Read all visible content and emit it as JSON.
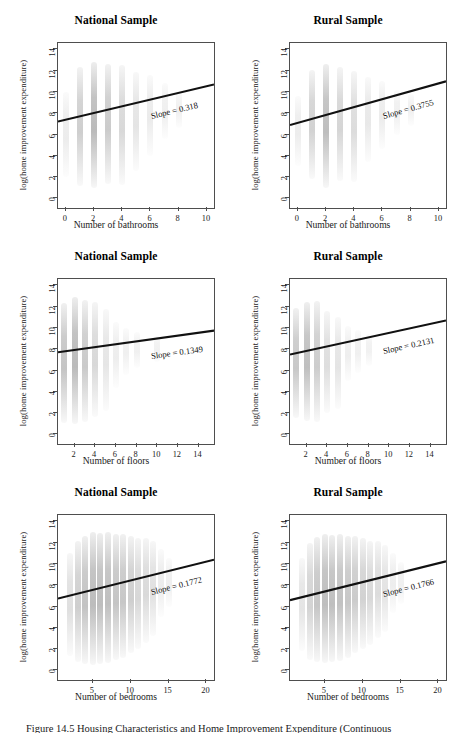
{
  "figure": {
    "caption": "Figure 14.5 Housing Characteristics and Home Improvement Expenditure (Continuous"
  },
  "axis_common": {
    "ylabel": "log(home improvement expenditure)",
    "yticks": [
      "0",
      "2",
      "4",
      "6",
      "8",
      "10",
      "12",
      "14"
    ],
    "ylim": [
      -0.9,
      14.6
    ]
  },
  "chart_data": [
    {
      "type": "scatter",
      "title": "National Sample",
      "xlabel": "Number of bathrooms",
      "ylabel": "log(home improvement expenditure)",
      "xticks": [
        "0",
        "2",
        "4",
        "6",
        "8",
        "10"
      ],
      "yticks": [
        "0",
        "2",
        "4",
        "6",
        "8",
        "10",
        "12",
        "14"
      ],
      "xlim": [
        -0.55,
        10.5
      ],
      "ylim": [
        -0.9,
        14.6
      ],
      "grid": false,
      "annotation": "Slope = 0.318",
      "slope": 0.318,
      "intercept": 7.4,
      "fit_line": {
        "x0": -0.55,
        "y0": 7.22,
        "x1": 10.5,
        "y1": 10.7
      },
      "point_clusters": [
        {
          "x": 0,
          "ymin": 2.0,
          "ymax": 10.0,
          "density": 0.1
        },
        {
          "x": 1,
          "ymin": 1.2,
          "ymax": 12.3,
          "density": 0.55
        },
        {
          "x": 2,
          "ymin": 1.0,
          "ymax": 12.8,
          "density": 0.85
        },
        {
          "x": 3,
          "ymin": 1.4,
          "ymax": 12.6,
          "density": 0.6
        },
        {
          "x": 4,
          "ymin": 1.3,
          "ymax": 12.5,
          "density": 0.4
        },
        {
          "x": 5,
          "ymin": 2.6,
          "ymax": 11.9,
          "density": 0.22
        },
        {
          "x": 6,
          "ymin": 4.0,
          "ymax": 11.6,
          "density": 0.12
        },
        {
          "x": 7,
          "ymin": 5.6,
          "ymax": 10.8,
          "density": 0.06
        },
        {
          "x": 8,
          "ymin": 6.6,
          "ymax": 10.0,
          "density": 0.04
        }
      ]
    },
    {
      "type": "scatter",
      "title": "Rural Sample",
      "xlabel": "Number of bathrooms",
      "ylabel": "log(home improvement expenditure)",
      "xticks": [
        "0",
        "2",
        "4",
        "6",
        "8",
        "10"
      ],
      "yticks": [
        "0",
        "2",
        "4",
        "6",
        "8",
        "10",
        "12",
        "14"
      ],
      "xlim": [
        -0.55,
        10.5
      ],
      "ylim": [
        -0.9,
        14.6
      ],
      "grid": false,
      "annotation": "Slope = 0.3755",
      "slope": 0.3755,
      "intercept": 7.1,
      "fit_line": {
        "x0": -0.55,
        "y0": 6.9,
        "x1": 10.5,
        "y1": 11.0
      },
      "point_clusters": [
        {
          "x": 0,
          "ymin": 3.0,
          "ymax": 9.6,
          "density": 0.09
        },
        {
          "x": 1,
          "ymin": 1.8,
          "ymax": 12.1,
          "density": 0.5
        },
        {
          "x": 2,
          "ymin": 1.0,
          "ymax": 12.6,
          "density": 0.8
        },
        {
          "x": 3,
          "ymin": 1.6,
          "ymax": 12.3,
          "density": 0.45
        },
        {
          "x": 4,
          "ymin": 1.5,
          "ymax": 12.0,
          "density": 0.35
        },
        {
          "x": 5,
          "ymin": 3.4,
          "ymax": 11.4,
          "density": 0.16
        },
        {
          "x": 6,
          "ymin": 4.6,
          "ymax": 11.0,
          "density": 0.1
        },
        {
          "x": 7,
          "ymin": 6.0,
          "ymax": 10.2,
          "density": 0.05
        },
        {
          "x": 8,
          "ymin": 6.8,
          "ymax": 9.8,
          "density": 0.03
        }
      ]
    },
    {
      "type": "scatter",
      "title": "National Sample",
      "xlabel": "Number of floors",
      "ylabel": "log(home improvement expenditure)",
      "xticks": [
        "2",
        "4",
        "6",
        "8",
        "10",
        "12",
        "14"
      ],
      "yticks": [
        "0",
        "2",
        "4",
        "6",
        "8",
        "10",
        "12",
        "14"
      ],
      "xlim": [
        0.4,
        15.5
      ],
      "ylim": [
        -0.9,
        14.6
      ],
      "grid": false,
      "annotation": "Slope = 0.1349",
      "slope": 0.1349,
      "intercept": 7.6,
      "fit_line": {
        "x0": 0.4,
        "y0": 7.72,
        "x1": 15.5,
        "y1": 9.75
      },
      "point_clusters": [
        {
          "x": 1,
          "ymin": 1.1,
          "ymax": 12.3,
          "density": 0.7
        },
        {
          "x": 2,
          "ymin": 1.0,
          "ymax": 12.9,
          "density": 0.85
        },
        {
          "x": 3,
          "ymin": 1.2,
          "ymax": 12.6,
          "density": 0.62
        },
        {
          "x": 4,
          "ymin": 1.6,
          "ymax": 12.4,
          "density": 0.4
        },
        {
          "x": 5,
          "ymin": 2.2,
          "ymax": 11.8,
          "density": 0.2
        },
        {
          "x": 6,
          "ymin": 4.4,
          "ymax": 10.6,
          "density": 0.08
        },
        {
          "x": 7,
          "ymin": 5.6,
          "ymax": 10.0,
          "density": 0.05
        },
        {
          "x": 8,
          "ymin": 6.2,
          "ymax": 9.6,
          "density": 0.04
        },
        {
          "x": 10,
          "ymin": 6.8,
          "ymax": 9.2,
          "density": 0.03
        }
      ]
    },
    {
      "type": "scatter",
      "title": "Rural Sample",
      "xlabel": "Number of floors",
      "ylabel": "log(home improvement expenditure)",
      "xticks": [
        "2",
        "4",
        "6",
        "8",
        "10",
        "12",
        "14"
      ],
      "yticks": [
        "0",
        "2",
        "4",
        "6",
        "8",
        "10",
        "12",
        "14"
      ],
      "xlim": [
        0.4,
        15.5
      ],
      "ylim": [
        -0.9,
        14.6
      ],
      "grid": false,
      "annotation": "Slope = 0.2131",
      "slope": 0.2131,
      "intercept": 7.4,
      "fit_line": {
        "x0": 0.4,
        "y0": 7.5,
        "x1": 15.5,
        "y1": 10.7
      },
      "point_clusters": [
        {
          "x": 1,
          "ymin": 1.5,
          "ymax": 11.9,
          "density": 0.65
        },
        {
          "x": 2,
          "ymin": 1.3,
          "ymax": 12.4,
          "density": 0.78
        },
        {
          "x": 3,
          "ymin": 1.2,
          "ymax": 12.5,
          "density": 0.58
        },
        {
          "x": 4,
          "ymin": 2.0,
          "ymax": 11.6,
          "density": 0.32
        },
        {
          "x": 5,
          "ymin": 2.4,
          "ymax": 11.0,
          "density": 0.22
        },
        {
          "x": 6,
          "ymin": 5.0,
          "ymax": 10.2,
          "density": 0.07
        },
        {
          "x": 7,
          "ymin": 5.8,
          "ymax": 9.8,
          "density": 0.04
        },
        {
          "x": 8,
          "ymin": 6.4,
          "ymax": 9.4,
          "density": 0.03
        }
      ]
    },
    {
      "type": "scatter",
      "title": "National Sample",
      "xlabel": "Number of bedrooms",
      "ylabel": "log(home improvement expenditure)",
      "xticks": [
        "5",
        "10",
        "15",
        "20"
      ],
      "yticks": [
        "0",
        "2",
        "4",
        "6",
        "8",
        "10",
        "12",
        "14"
      ],
      "xlim": [
        0.4,
        21.0
      ],
      "ylim": [
        -0.9,
        14.6
      ],
      "grid": false,
      "annotation": "Slope = 0.1772",
      "slope": 0.1772,
      "intercept": 6.6,
      "fit_line": {
        "x0": 0.4,
        "y0": 6.75,
        "x1": 21.0,
        "y1": 10.4
      },
      "point_clusters": [
        {
          "x": 2,
          "ymin": 1.4,
          "ymax": 11.0,
          "density": 0.3
        },
        {
          "x": 3,
          "ymin": 0.8,
          "ymax": 12.2,
          "density": 0.55
        },
        {
          "x": 4,
          "ymin": 0.6,
          "ymax": 12.6,
          "density": 0.72
        },
        {
          "x": 5,
          "ymin": 0.5,
          "ymax": 13.0,
          "density": 0.82
        },
        {
          "x": 6,
          "ymin": 0.6,
          "ymax": 12.9,
          "density": 0.8
        },
        {
          "x": 7,
          "ymin": 0.7,
          "ymax": 13.0,
          "density": 0.78
        },
        {
          "x": 8,
          "ymin": 1.0,
          "ymax": 12.8,
          "density": 0.7
        },
        {
          "x": 9,
          "ymin": 1.2,
          "ymax": 12.8,
          "density": 0.66
        },
        {
          "x": 10,
          "ymin": 1.6,
          "ymax": 12.6,
          "density": 0.55
        },
        {
          "x": 11,
          "ymin": 2.0,
          "ymax": 12.4,
          "density": 0.42
        },
        {
          "x": 12,
          "ymin": 2.6,
          "ymax": 12.4,
          "density": 0.38
        },
        {
          "x": 13,
          "ymin": 3.2,
          "ymax": 12.2,
          "density": 0.28
        },
        {
          "x": 14,
          "ymin": 5.0,
          "ymax": 11.4,
          "density": 0.1
        },
        {
          "x": 15,
          "ymin": 6.0,
          "ymax": 10.6,
          "density": 0.06
        }
      ]
    },
    {
      "type": "scatter",
      "title": "Rural Sample",
      "xlabel": "Number of bedrooms",
      "ylabel": "log(home improvement expenditure)",
      "xticks": [
        "5",
        "10",
        "15",
        "20"
      ],
      "yticks": [
        "0",
        "2",
        "4",
        "6",
        "8",
        "10",
        "12",
        "14"
      ],
      "xlim": [
        0.4,
        21.0
      ],
      "ylim": [
        -0.9,
        14.6
      ],
      "grid": false,
      "annotation": "Slope = 0.1766",
      "slope": 0.1766,
      "intercept": 6.5,
      "fit_line": {
        "x0": 0.4,
        "y0": 6.6,
        "x1": 21.0,
        "y1": 10.25
      },
      "point_clusters": [
        {
          "x": 2,
          "ymin": 1.8,
          "ymax": 10.6,
          "density": 0.22
        },
        {
          "x": 3,
          "ymin": 1.0,
          "ymax": 12.0,
          "density": 0.48
        },
        {
          "x": 4,
          "ymin": 0.8,
          "ymax": 12.5,
          "density": 0.68
        },
        {
          "x": 5,
          "ymin": 0.7,
          "ymax": 12.8,
          "density": 0.8
        },
        {
          "x": 6,
          "ymin": 0.8,
          "ymax": 12.7,
          "density": 0.78
        },
        {
          "x": 7,
          "ymin": 0.9,
          "ymax": 12.8,
          "density": 0.74
        },
        {
          "x": 8,
          "ymin": 1.2,
          "ymax": 12.6,
          "density": 0.66
        },
        {
          "x": 9,
          "ymin": 1.6,
          "ymax": 12.6,
          "density": 0.6
        },
        {
          "x": 10,
          "ymin": 2.0,
          "ymax": 12.4,
          "density": 0.5
        },
        {
          "x": 11,
          "ymin": 2.4,
          "ymax": 12.2,
          "density": 0.4
        },
        {
          "x": 12,
          "ymin": 3.0,
          "ymax": 12.2,
          "density": 0.34
        },
        {
          "x": 13,
          "ymin": 3.6,
          "ymax": 11.8,
          "density": 0.24
        },
        {
          "x": 14,
          "ymin": 5.4,
          "ymax": 11.0,
          "density": 0.09
        },
        {
          "x": 15,
          "ymin": 6.2,
          "ymax": 10.2,
          "density": 0.05
        }
      ]
    }
  ]
}
